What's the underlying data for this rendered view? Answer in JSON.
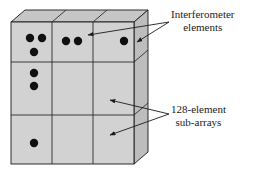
{
  "figure": {
    "name": "phased-array-panel-diagram",
    "background_color": "#ffffff"
  },
  "slab": {
    "face_color": "#d0d0d0",
    "top_color": "#c4c4c4",
    "side_color": "#bcbcbc",
    "outline_color": "#1a1a1a",
    "grid_color": "#333333",
    "rows": 3,
    "columns": 3
  },
  "elements": {
    "dot_color": "#101010",
    "dot_radius": 4.2,
    "points": [
      {
        "cell": "row1-col1",
        "x": 30,
        "y": 38
      },
      {
        "cell": "row1-col1",
        "x": 42,
        "y": 38
      },
      {
        "cell": "row1-col1",
        "x": 34,
        "y": 52
      },
      {
        "cell": "row2-col1",
        "x": 34,
        "y": 73
      },
      {
        "cell": "row2-col1",
        "x": 34,
        "y": 86
      },
      {
        "cell": "row3-col1",
        "x": 34,
        "y": 143
      },
      {
        "cell": "row1-col2",
        "x": 66,
        "y": 41
      },
      {
        "cell": "row1-col2",
        "x": 78,
        "y": 41
      },
      {
        "cell": "row1-col3",
        "x": 124,
        "y": 41
      }
    ]
  },
  "annotations": {
    "interferometer": {
      "id": "interferometer-elements-label",
      "line1": "Interferometer",
      "line2": "elements",
      "anchor_x": 169,
      "anchor_y": 22,
      "arrows": [
        {
          "to_x": 86,
          "to_y": 35
        },
        {
          "to_x": 135,
          "to_y": 41
        }
      ]
    },
    "subarrays": {
      "id": "128-element-sub-arrays-label",
      "line1": "128-element",
      "line2": "sub-arrays",
      "anchor_x": 169,
      "anchor_y": 114,
      "arrows": [
        {
          "to_x": 110,
          "to_y": 100
        },
        {
          "to_x": 110,
          "to_y": 134
        }
      ]
    }
  }
}
